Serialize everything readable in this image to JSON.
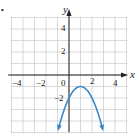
{
  "chart_data": {
    "type": "line",
    "title": "",
    "xlabel": "x",
    "ylabel": "y",
    "xlim": [
      -5,
      5
    ],
    "ylim": [
      -5,
      5
    ],
    "grid": true,
    "grid_step": 1,
    "x_ticks": [
      -4,
      -2,
      0,
      2,
      4
    ],
    "y_ticks": [
      4,
      2,
      -2
    ],
    "x_tick_labels": [
      "−4",
      "−2",
      "0",
      "2",
      "4"
    ],
    "y_tick_labels": [
      "4",
      "2",
      "−2"
    ],
    "series": [
      {
        "name": "parabola",
        "equation": "y = -(x - 1)^2 - 1",
        "vertex": [
          1,
          -1
        ],
        "x": [
          -0.9,
          -0.5,
          0,
          0.5,
          1,
          1.5,
          2,
          2.5,
          2.9
        ],
        "y": [
          -4.61,
          -3.25,
          -2,
          -1.25,
          -1,
          -1.25,
          -2,
          -3.25,
          -4.61
        ],
        "arrows_at_ends": true,
        "color": "#3a87c8"
      }
    ],
    "colors": {
      "grid": "#c8c8c8",
      "axis": "#222222",
      "curve": "#3a87c8"
    }
  },
  "labels": {
    "x_axis": "x",
    "y_axis": "y",
    "bullet": "•",
    "ticks": {
      "xm4": "−4",
      "xm2": "−2",
      "x0": "0",
      "x2": "2",
      "x4": "4",
      "y4": "4",
      "y2": "2",
      "ym2": "−2"
    }
  }
}
